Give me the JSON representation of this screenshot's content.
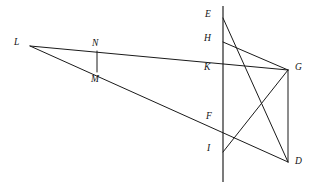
{
  "figure": {
    "kind": "geometry-diagram",
    "width": 316,
    "height": 188,
    "background_color": "#ffffff",
    "stroke_color": "#1a1a1a",
    "label_color": "#111111"
  },
  "points": {
    "E": {
      "label": "E",
      "x": 223,
      "y": 18,
      "label_x": 205,
      "label_y": 10
    },
    "H": {
      "label": "H",
      "x": 223,
      "y": 42,
      "label_x": 204,
      "label_y": 34
    },
    "K": {
      "label": "K",
      "x": 223,
      "y": 70,
      "label_x": 204,
      "label_y": 63
    },
    "F": {
      "label": "F",
      "x": 223,
      "y": 120,
      "label_x": 206,
      "label_y": 112
    },
    "I": {
      "label": "I",
      "x": 223,
      "y": 152,
      "label_x": 207,
      "label_y": 144
    },
    "G": {
      "label": "G",
      "x": 288,
      "y": 70,
      "label_x": 295,
      "label_y": 63
    },
    "D": {
      "label": "D",
      "x": 288,
      "y": 162,
      "label_x": 295,
      "label_y": 157
    },
    "L": {
      "label": "L",
      "x": 30,
      "y": 46,
      "label_x": 14,
      "label_y": 38
    },
    "N": {
      "label": "N",
      "x": 97,
      "y": 51,
      "label_x": 92,
      "label_y": 39
    },
    "M": {
      "label": "M",
      "x": 97,
      "y": 72,
      "label_x": 91,
      "label_y": 75
    }
  },
  "segments": [
    {
      "name": "vertical-axis-EI",
      "from": "E",
      "to": "I",
      "x1": 223,
      "y1": 6,
      "x2": 223,
      "y2": 182,
      "style": "axis"
    },
    {
      "name": "segment-LG",
      "from": "L",
      "to": "G",
      "x1": 30,
      "y1": 46,
      "x2": 288,
      "y2": 70,
      "style": "geom"
    },
    {
      "name": "segment-LD",
      "from": "L",
      "to": "D",
      "x1": 30,
      "y1": 46,
      "x2": 288,
      "y2": 162,
      "style": "geom"
    },
    {
      "name": "segment-NM",
      "from": "N",
      "to": "M",
      "x1": 97,
      "y1": 51,
      "x2": 97,
      "y2": 72,
      "style": "geom"
    },
    {
      "name": "segment-ED",
      "from": "E",
      "to": "D",
      "x1": 223,
      "y1": 18,
      "x2": 288,
      "y2": 162,
      "style": "geom"
    },
    {
      "name": "segment-HG",
      "from": "H",
      "to": "G",
      "x1": 223,
      "y1": 42,
      "x2": 288,
      "y2": 70,
      "style": "geom"
    },
    {
      "name": "segment-IG",
      "from": "I",
      "to": "G",
      "x1": 223,
      "y1": 152,
      "x2": 288,
      "y2": 70,
      "style": "geom"
    },
    {
      "name": "segment-GD",
      "from": "G",
      "to": "D",
      "x1": 288,
      "y1": 70,
      "x2": 288,
      "y2": 162,
      "style": "geom"
    }
  ],
  "label_order": [
    "E",
    "H",
    "K",
    "F",
    "I",
    "G",
    "D",
    "L",
    "N",
    "M"
  ]
}
